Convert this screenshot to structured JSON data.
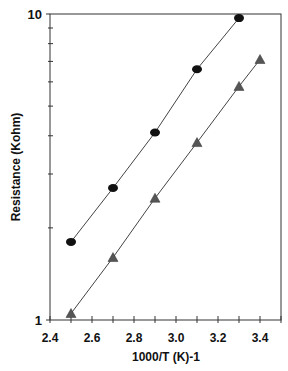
{
  "chart_data": {
    "type": "line",
    "title": "",
    "xlabel": "1000/T  (K)-1",
    "ylabel": "Resistance (Kohm)",
    "xlim": [
      2.4,
      3.5
    ],
    "ylim": [
      1,
      10
    ],
    "yscale": "log",
    "xticks": [
      "2.4",
      "2.6",
      "2.8",
      "3.0",
      "3.2",
      "3.4"
    ],
    "yticks": [
      "1",
      "10"
    ],
    "grid": false,
    "legend": null,
    "series": [
      {
        "name": "circles",
        "marker": "circle",
        "x": [
          2.5,
          2.7,
          2.9,
          3.1,
          3.3
        ],
        "values": [
          1.8,
          2.7,
          4.1,
          6.6,
          9.7
        ]
      },
      {
        "name": "triangles",
        "marker": "triangle",
        "x": [
          2.5,
          2.7,
          2.9,
          3.1,
          3.3,
          3.4
        ],
        "values": [
          1.05,
          1.6,
          2.5,
          3.8,
          5.8,
          7.1
        ]
      }
    ]
  }
}
